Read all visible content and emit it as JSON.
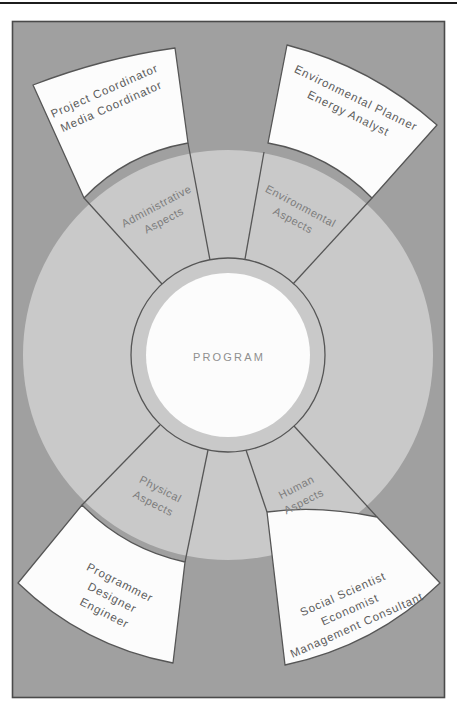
{
  "colors": {
    "page_bg": "#ffffff",
    "rule": "#1c1c1c",
    "panel": "#a0a0a0",
    "panel_border": "#4a4a4a",
    "disc": "#c9c9c9",
    "line": "#565656",
    "white": "#fcfcfc",
    "center_text": "#8f8f8f",
    "sector_text": "#7c7c7c",
    "role_text": "#5d5d5d"
  },
  "diagram": {
    "center_label": "PROGRAM",
    "sectors": [
      {
        "name": "administrative",
        "lines": [
          "Administrative",
          "Aspects"
        ]
      },
      {
        "name": "environmental",
        "lines": [
          "Environmental",
          "Aspects"
        ]
      },
      {
        "name": "physical",
        "lines": [
          "Physical",
          "Aspects"
        ]
      },
      {
        "name": "human",
        "lines": [
          "Human",
          "Aspects"
        ]
      }
    ],
    "roles": [
      {
        "name": "administrative-roles",
        "lines": [
          "Project Coordinator",
          "Media Coordinator"
        ]
      },
      {
        "name": "environmental-roles",
        "lines": [
          "Environmental Planner",
          "Energy Analyst"
        ]
      },
      {
        "name": "physical-roles",
        "lines": [
          "Programmer",
          "Designer",
          "Engineer"
        ]
      },
      {
        "name": "human-roles",
        "lines": [
          "Social Scientist",
          "Economist",
          "Management Consultant"
        ]
      }
    ]
  }
}
